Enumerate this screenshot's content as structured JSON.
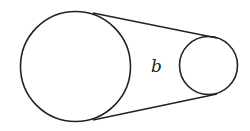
{
  "diagram": {
    "stroke_color": "#222222",
    "background": "#ffffff",
    "large_pulley": {
      "cx": 75.5,
      "cy": 66.5,
      "r": 55
    },
    "small_pulley": {
      "cx": 208.5,
      "cy": 65.5,
      "r": 29
    },
    "belt_top": {
      "x1": 93,
      "y1": 13,
      "x2": 217,
      "y2": 38
    },
    "belt_bottom": {
      "x1": 93,
      "y1": 120,
      "x2": 217,
      "y2": 94
    },
    "label": {
      "text": "b",
      "x": 151,
      "y": 72
    }
  }
}
